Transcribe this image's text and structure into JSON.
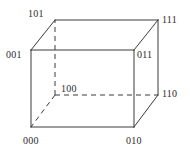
{
  "figure": {
    "kind": "cube-diagram",
    "stroke_color": "#3a3a3a",
    "hidden_stroke_color": "#3a3a3a",
    "background_color": "#ffffff",
    "label_color": "#2b2b2b"
  },
  "vertices": [
    {
      "code": "101",
      "position": "back-top-left",
      "hidden": false
    },
    {
      "code": "111",
      "position": "back-top-right",
      "hidden": false
    },
    {
      "code": "001",
      "position": "front-top-left",
      "hidden": false
    },
    {
      "code": "011",
      "position": "front-top-right",
      "hidden": false
    },
    {
      "code": "100",
      "position": "back-bottom-left",
      "hidden": true
    },
    {
      "code": "110",
      "position": "back-bottom-right",
      "hidden": false
    },
    {
      "code": "000",
      "position": "front-bottom-left",
      "hidden": false
    },
    {
      "code": "010",
      "position": "front-bottom-right",
      "hidden": false
    }
  ],
  "edges": {
    "solid": [
      "001-011",
      "011-010",
      "010-000",
      "000-001",
      "101-111",
      "111-110",
      "110-010",
      "101-001",
      "111-011"
    ],
    "dashed": [
      "100-101",
      "100-110",
      "100-000"
    ]
  }
}
